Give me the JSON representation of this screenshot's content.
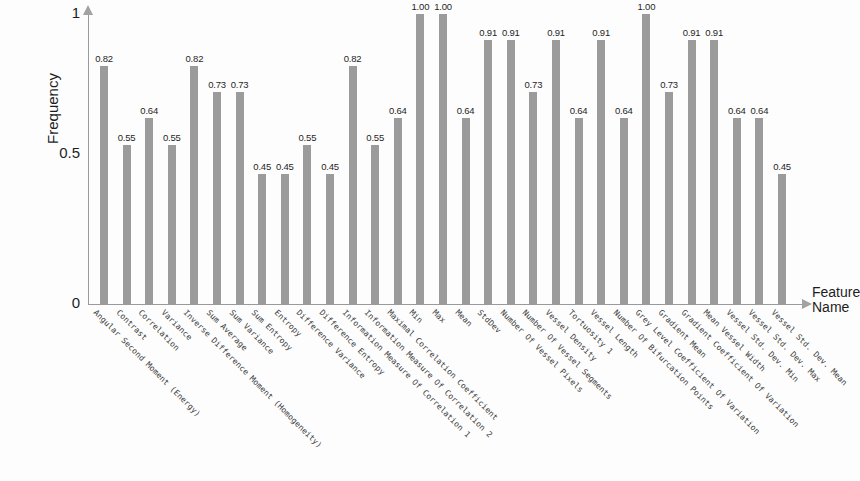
{
  "chart_data": {
    "type": "bar",
    "title": "",
    "xlabel": "Feature Name",
    "ylabel": "Frequency",
    "ylim": [
      0,
      1
    ],
    "ytick_labels": [
      "0",
      "0.5",
      "1"
    ],
    "ytick_values": [
      0,
      0.5,
      1
    ],
    "grid": false,
    "legend": null,
    "bar_color": "#9b9b9b",
    "axis_color": "#9a9a9a",
    "categories": [
      "Angular Second Moment (Energy)",
      "Contrast",
      "Correlation",
      "Variance",
      "Inverse Difference Moment (Homogeneity)",
      "Sum Average",
      "Sum Variance",
      "Sum Entropy",
      "Entropy",
      "Difference Variance",
      "Difference Entropy",
      "Information Measure Of Correlation 1",
      "Information Measure Of Correlation 2",
      "Maximal Correlation Coefficient",
      "Min",
      "Max",
      "Mean",
      "StdDev",
      "Number Of Vessel Pixels",
      "Number Of Vessel Segments",
      "Vessel Density",
      "Tortuosity 1",
      "Vessel Length",
      "Number Of Bifurcation Points",
      "Grey Level Coefficient Of Variation",
      "Gradient Mean",
      "Gradient Coefficient Of Variation",
      "Mean Vessel Width",
      "Vessel Std. Dev. Min",
      "Vessel Std. Dev. Max",
      "Vessel Std. Dev. Mean"
    ],
    "values": [
      0.82,
      0.55,
      0.64,
      0.55,
      0.82,
      0.73,
      0.73,
      0.45,
      0.45,
      0.55,
      0.45,
      0.82,
      0.55,
      0.64,
      1.0,
      1.0,
      0.64,
      0.91,
      0.91,
      0.73,
      0.91,
      0.64,
      0.91,
      0.64,
      1.0,
      0.73,
      0.91,
      0.91,
      0.64,
      0.64,
      0.45
    ],
    "value_labels": [
      "0.82",
      "0.55",
      "0.64",
      "0.55",
      "0.82",
      "0.73",
      "0.73",
      "0.45",
      "0.45",
      "0.55",
      "0.45",
      "0.82",
      "0.55",
      "0.64",
      "1.00",
      "1.00",
      "0.64",
      "0.91",
      "0.91",
      "0.73",
      "0.91",
      "0.64",
      "0.91",
      "0.64",
      "1.00",
      "0.73",
      "0.91",
      "0.91",
      "0.64",
      "0.64",
      "0.45"
    ]
  }
}
